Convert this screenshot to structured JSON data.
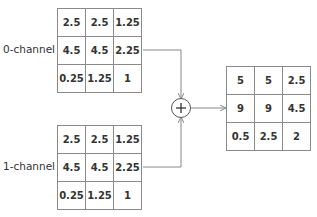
{
  "diagram": {
    "operation": "+",
    "inputs": [
      {
        "label": "0-channel",
        "rows": [
          [
            "2.5",
            "2.5",
            "1.25"
          ],
          [
            "4.5",
            "4.5",
            "2.25"
          ],
          [
            "0.25",
            "1.25",
            "1"
          ]
        ]
      },
      {
        "label": "1-channel",
        "rows": [
          [
            "2.5",
            "2.5",
            "1.25"
          ],
          [
            "4.5",
            "4.5",
            "2.25"
          ],
          [
            "0.25",
            "1.25",
            "1"
          ]
        ]
      }
    ],
    "output": {
      "rows": [
        [
          "5",
          "5",
          "2.5"
        ],
        [
          "9",
          "9",
          "4.5"
        ],
        [
          "0.5",
          "2.5",
          "2"
        ]
      ]
    }
  }
}
